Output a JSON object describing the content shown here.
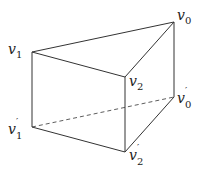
{
  "diagram": {
    "vertices": [
      {
        "id": "v0",
        "name": "v",
        "sub": "0",
        "prime": "",
        "x": 174,
        "y": 22,
        "lx": 178,
        "ly": 19
      },
      {
        "id": "v1",
        "name": "v",
        "sub": "1",
        "prime": "",
        "x": 32,
        "y": 52,
        "lx": 8,
        "ly": 51
      },
      {
        "id": "v2",
        "name": "v",
        "sub": "2",
        "prime": "",
        "x": 125,
        "y": 77,
        "lx": 130,
        "ly": 86
      },
      {
        "id": "v0p",
        "name": "v",
        "sub": "0",
        "prime": "′",
        "x": 174,
        "y": 97,
        "lx": 178,
        "ly": 103
      },
      {
        "id": "v1p",
        "name": "v",
        "sub": "1",
        "prime": "′",
        "x": 32,
        "y": 127,
        "lx": 8,
        "ly": 134
      },
      {
        "id": "v2p",
        "name": "v",
        "sub": "2",
        "prime": "′",
        "x": 125,
        "y": 152,
        "lx": 130,
        "ly": 161
      }
    ],
    "edges": [
      {
        "from": "v0",
        "to": "v1",
        "style": "solid"
      },
      {
        "from": "v1",
        "to": "v2",
        "style": "solid"
      },
      {
        "from": "v2",
        "to": "v0",
        "style": "solid"
      },
      {
        "from": "v1",
        "to": "v1p",
        "style": "solid"
      },
      {
        "from": "v2",
        "to": "v2p",
        "style": "solid"
      },
      {
        "from": "v0",
        "to": "v0p",
        "style": "solid"
      },
      {
        "from": "v1p",
        "to": "v2p",
        "style": "solid"
      },
      {
        "from": "v2p",
        "to": "v0p",
        "style": "solid"
      },
      {
        "from": "v1p",
        "to": "v0p",
        "style": "dashed"
      }
    ],
    "labels": {
      "v0": "v",
      "v1": "v",
      "v2": "v",
      "v0p": "v",
      "v1p": "v",
      "v2p": "v",
      "sub0": "0",
      "sub1": "1",
      "sub2": "2",
      "prime": "′"
    }
  }
}
